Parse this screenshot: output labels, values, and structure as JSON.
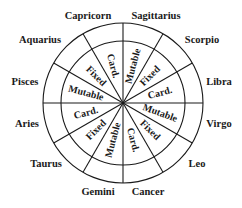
{
  "diagram": {
    "center": [
      123,
      103
    ],
    "outer_radius": 80,
    "inner_radius": 62,
    "line_color": "#1a1a1a",
    "signs": [
      {
        "name": "Capricorn",
        "x": 88,
        "y": 16
      },
      {
        "name": "Sagittarius",
        "x": 156,
        "y": 16
      },
      {
        "name": "Scorpio",
        "x": 202,
        "y": 40
      },
      {
        "name": "Libra",
        "x": 219,
        "y": 82
      },
      {
        "name": "Virgo",
        "x": 219,
        "y": 124
      },
      {
        "name": "Leo",
        "x": 197,
        "y": 164
      },
      {
        "name": "Cancer",
        "x": 148,
        "y": 192
      },
      {
        "name": "Gemini",
        "x": 98,
        "y": 192
      },
      {
        "name": "Taurus",
        "x": 46,
        "y": 164
      },
      {
        "name": "Aries",
        "x": 27,
        "y": 124
      },
      {
        "name": "Pisces",
        "x": 25,
        "y": 82
      },
      {
        "name": "Aquarius",
        "x": 40,
        "y": 40
      }
    ],
    "modes": [
      {
        "label": "Mutable",
        "angle": 15,
        "rotate": -75
      },
      {
        "label": "Fixed",
        "angle": 45,
        "rotate": -45
      },
      {
        "label": "Card.",
        "angle": 75,
        "rotate": -15
      },
      {
        "label": "Mutable",
        "angle": 105,
        "rotate": 20
      },
      {
        "label": "Fixed",
        "angle": 135,
        "rotate": 45
      },
      {
        "label": "Card.",
        "angle": 165,
        "rotate": 75
      },
      {
        "label": "Mutable",
        "angle": 195,
        "rotate": -75
      },
      {
        "label": "Fixed",
        "angle": 225,
        "rotate": -45
      },
      {
        "label": "Card.",
        "angle": 255,
        "rotate": -15
      },
      {
        "label": "Mutable",
        "angle": 285,
        "rotate": 15
      },
      {
        "label": "Fixed",
        "angle": 315,
        "rotate": 45
      },
      {
        "label": "Card.",
        "angle": 345,
        "rotate": 75
      }
    ],
    "mode_label_radius": 38
  }
}
